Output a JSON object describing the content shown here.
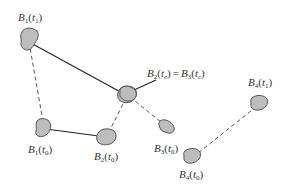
{
  "diagram": {
    "labels": {
      "b1_t1": {
        "base": "B",
        "sub": "1",
        "arg": "t",
        "argsub": "1"
      },
      "center": {
        "left_base": "B",
        "left_sub": "2",
        "left_arg": "t",
        "left_argsub": "c",
        "equals": "=",
        "right_base": "B",
        "right_sub": "3",
        "right_arg": "t",
        "right_argsub": "c"
      },
      "b1_t0": {
        "base": "B",
        "sub": "1",
        "arg": "t",
        "argsub": "0"
      },
      "b2_t0": {
        "base": "B",
        "sub": "2",
        "arg": "t",
        "argsub": "0"
      },
      "b3_t0": {
        "base": "B",
        "sub": "3",
        "arg": "t",
        "argsub": "0"
      },
      "b4_t0": {
        "base": "B",
        "sub": "4",
        "arg": "t",
        "argsub": "0"
      },
      "b4_t1": {
        "base": "B",
        "sub": "4",
        "arg": "t",
        "argsub": "1"
      }
    },
    "colors": {
      "blob_fill": "#bdbdbd",
      "blob_stroke": "#555555",
      "line": "#222222"
    }
  }
}
